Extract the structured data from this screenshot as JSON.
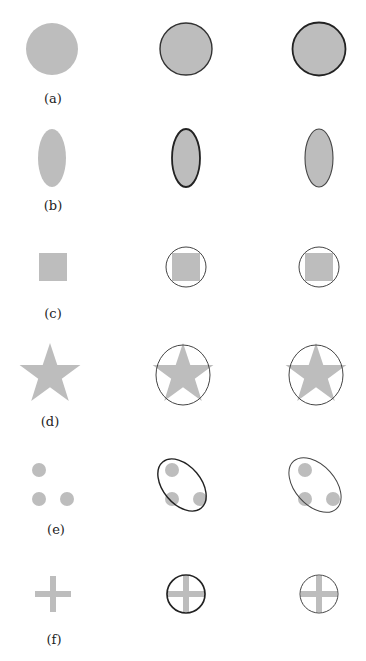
{
  "figure": {
    "fill_color": "#bdbdbd",
    "outline_color": "#333333",
    "rows": [
      {
        "label": "(a)",
        "shape": "circle",
        "enclosure": "circle"
      },
      {
        "label": "(b)",
        "shape": "ellipse",
        "enclosure": "ellipse"
      },
      {
        "label": "(c)",
        "shape": "square",
        "enclosure": "circle"
      },
      {
        "label": "(d)",
        "shape": "star",
        "enclosure": "circle"
      },
      {
        "label": "(e)",
        "shape": "three-dots",
        "enclosure": "tilted-ellipse"
      },
      {
        "label": "(f)",
        "shape": "cross",
        "enclosure": "circle"
      }
    ],
    "columns": [
      "shape",
      "enclosing-shape-1",
      "enclosing-shape-2"
    ]
  }
}
